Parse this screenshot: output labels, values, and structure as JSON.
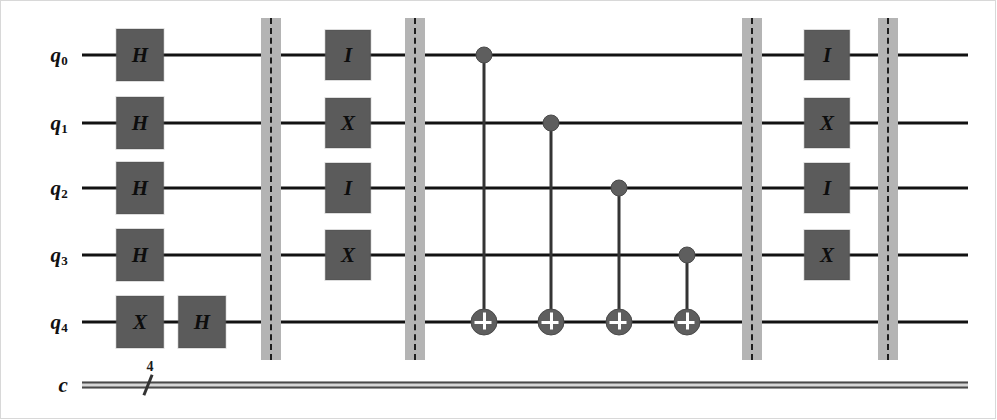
{
  "figure": {
    "kind": "quantum-circuit-diagram",
    "width": 997,
    "height": 420,
    "background_color": "#ffffff"
  },
  "colors": {
    "gate_fill": "#5b5b5b",
    "gate_text": "#0d0d0d",
    "wire": "#121212",
    "barrier_band": "#b4b4b4",
    "barrier_dash": "#1d1d1d",
    "control_dot": "#5e5e5e",
    "classical_wire": "#4a4a4a",
    "target_cross": "#ffffff"
  },
  "registers": {
    "quantum": [
      {
        "name": "q0",
        "label": "q",
        "index": "0",
        "y": 55
      },
      {
        "name": "q1",
        "label": "q",
        "index": "1",
        "y": 123
      },
      {
        "name": "q2",
        "label": "q",
        "index": "2",
        "y": 188
      },
      {
        "name": "q3",
        "label": "q",
        "index": "3",
        "y": 255
      },
      {
        "name": "q4",
        "label": "q",
        "index": "4",
        "y": 322
      }
    ],
    "classical": {
      "name": "c",
      "label": "c",
      "index": "",
      "y": 385,
      "bit_count": "4"
    },
    "label_x": 68,
    "wire_start_x": 82,
    "wire_end_x": 968
  },
  "gates": [
    {
      "name": "h-gate-q0-col0",
      "op": "H",
      "text": "H",
      "x": 140,
      "y": 55,
      "w": 47,
      "h": 52
    },
    {
      "name": "h-gate-q1-col0",
      "op": "H",
      "text": "H",
      "x": 140,
      "y": 123,
      "w": 47,
      "h": 52
    },
    {
      "name": "h-gate-q2-col0",
      "op": "H",
      "text": "H",
      "x": 140,
      "y": 188,
      "w": 47,
      "h": 52
    },
    {
      "name": "h-gate-q3-col0",
      "op": "H",
      "text": "H",
      "x": 140,
      "y": 255,
      "w": 47,
      "h": 52
    },
    {
      "name": "x-gate-q4-col0",
      "op": "X",
      "text": "X",
      "x": 140,
      "y": 322,
      "w": 47,
      "h": 52
    },
    {
      "name": "h-gate-q4-col1",
      "op": "H",
      "text": "H",
      "x": 202,
      "y": 322,
      "w": 47,
      "h": 52
    },
    {
      "name": "i-gate-q0-col2",
      "op": "I",
      "text": "I",
      "x": 348,
      "y": 55,
      "w": 45,
      "h": 50
    },
    {
      "name": "x-gate-q1-col2",
      "op": "X",
      "text": "X",
      "x": 348,
      "y": 123,
      "w": 45,
      "h": 50
    },
    {
      "name": "i-gate-q2-col2",
      "op": "I",
      "text": "I",
      "x": 348,
      "y": 188,
      "w": 45,
      "h": 50
    },
    {
      "name": "x-gate-q3-col2",
      "op": "X",
      "text": "X",
      "x": 348,
      "y": 255,
      "w": 45,
      "h": 50
    },
    {
      "name": "i-gate-q0-col4",
      "op": "I",
      "text": "I",
      "x": 827,
      "y": 55,
      "w": 45,
      "h": 50
    },
    {
      "name": "x-gate-q1-col4",
      "op": "X",
      "text": "X",
      "x": 827,
      "y": 123,
      "w": 45,
      "h": 50
    },
    {
      "name": "i-gate-q2-col4",
      "op": "I",
      "text": "I",
      "x": 827,
      "y": 188,
      "w": 45,
      "h": 50
    },
    {
      "name": "x-gate-q3-col4",
      "op": "X",
      "text": "X",
      "x": 827,
      "y": 255,
      "w": 45,
      "h": 50
    }
  ],
  "barriers": [
    {
      "name": "barrier-1",
      "x": 271,
      "width": 20,
      "top": 18,
      "bottom": 360
    },
    {
      "name": "barrier-2",
      "x": 415,
      "width": 20,
      "top": 18,
      "bottom": 360
    },
    {
      "name": "barrier-3",
      "x": 752,
      "width": 20,
      "top": 18,
      "bottom": 360
    },
    {
      "name": "barrier-4",
      "x": 888,
      "width": 20,
      "top": 18,
      "bottom": 360
    }
  ],
  "cnots": [
    {
      "name": "cnot-q0-q4",
      "x": 484,
      "control_y": 55,
      "target_y": 322,
      "control_qubit": "q0",
      "target_qubit": "q4"
    },
    {
      "name": "cnot-q1-q4",
      "x": 551,
      "control_y": 123,
      "target_y": 322,
      "control_qubit": "q1",
      "target_qubit": "q4"
    },
    {
      "name": "cnot-q2-q4",
      "x": 619,
      "control_y": 188,
      "target_y": 322,
      "control_qubit": "q2",
      "target_qubit": "q4"
    },
    {
      "name": "cnot-q3-q4",
      "x": 687,
      "control_y": 255,
      "target_y": 322,
      "control_qubit": "q3",
      "target_qubit": "q4"
    }
  ]
}
